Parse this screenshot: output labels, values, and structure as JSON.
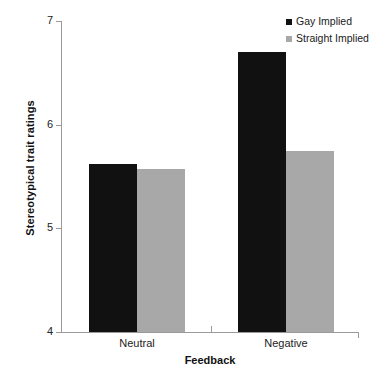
{
  "chart_data": {
    "type": "bar",
    "title": "",
    "subtitle": "",
    "xlabel": "Feedback",
    "ylabel": "Stereotypical trait ratings",
    "categories": [
      "Neutral",
      "Negative"
    ],
    "series": [
      {
        "name": "Gay Implied",
        "color": "#111111",
        "values": [
          5.62,
          6.7
        ]
      },
      {
        "name": "Straight Implied",
        "color": "#a8a8a8",
        "values": [
          5.57,
          5.75
        ]
      }
    ],
    "ylim": [
      4,
      7
    ],
    "yticks": [
      4,
      5,
      6,
      7
    ],
    "ytick_labels": [
      "4",
      "5",
      "6",
      "7"
    ],
    "grid": false,
    "legend_position": "top-right",
    "annotations": []
  },
  "axes": {
    "y_title": "Stereotypical trait ratings",
    "x_title": "Feedback"
  },
  "legend": {
    "items": [
      {
        "label": "Gay Implied",
        "swatch": "black-square-marker"
      },
      {
        "label": "Straight Implied",
        "swatch": "gray-square-marker"
      }
    ]
  }
}
